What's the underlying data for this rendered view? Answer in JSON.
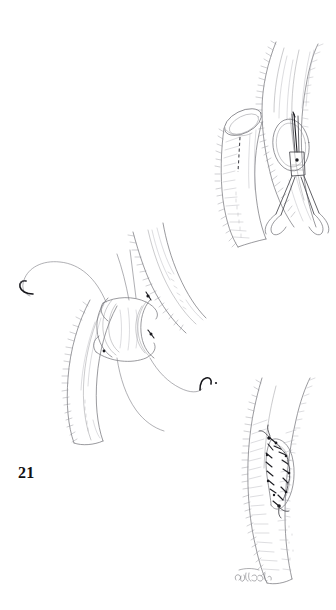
{
  "figure": {
    "number": "21",
    "caption_number_label": "21",
    "artist_signature": "Dobbs",
    "medium": "pen-and-ink line drawing",
    "background_color": "#ffffff",
    "ink_color": "#6e6e74",
    "dark_ink_color": "#1d1d22"
  },
  "panels": [
    {
      "id": "panel-top-right",
      "name": "arteriotomy-with-scissors",
      "position": "top-right",
      "description": "Longitudinal vessel held vertically with an elliptical arteriotomy being extended by fine scissors",
      "elements": [
        "vessel-segment",
        "elliptical-arteriotomy",
        "scissors-blades",
        "scissors-shanks",
        "scissors-handles"
      ]
    },
    {
      "id": "panel-mid-right",
      "name": "bevelled-graft-end",
      "position": "middle-right",
      "description": "Obliquely cut graft end showing open oval lumen with a dashed extension-incision line on the anterior wall",
      "elements": [
        "graft-tube",
        "oval-lumen",
        "dashed-incision-line",
        "wall-hatching"
      ]
    },
    {
      "id": "panel-center-left",
      "name": "side-to-side-anastomosis",
      "position": "center-left",
      "description": "Two vessels joined side to side with opened lumens and double-armed sutures with curved needles trailing to either side",
      "elements": [
        "recipient-vessel",
        "donor-vessel",
        "opened-anastomosis",
        "suture-thread-left",
        "curved-needle-left",
        "suture-thread-right",
        "curved-needle-right"
      ]
    },
    {
      "id": "panel-bottom-right",
      "name": "completed-sutured-anastomosis",
      "position": "bottom-right",
      "description": "Completed patch closure along the vessel with an interrupted running suture line around an elliptical defect",
      "elements": [
        "vessel-segment",
        "elliptical-patch",
        "running-suture-line",
        "suture-knots",
        "artist-signature"
      ]
    }
  ]
}
